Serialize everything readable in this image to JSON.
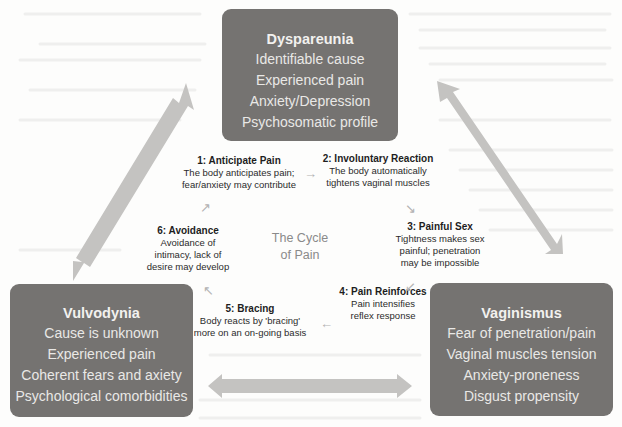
{
  "diagram": {
    "center_label": {
      "line1": "The Cycle",
      "line2": "of Pain"
    },
    "conditions": [
      {
        "id": "dyspareunia",
        "title": "Dyspareunia",
        "items": [
          "Identifiable cause",
          "Experienced pain",
          "Anxiety/Depression",
          "Psychosomatic profile"
        ]
      },
      {
        "id": "vulvodynia",
        "title": "Vulvodynia",
        "items": [
          "Cause is unknown",
          "Experienced pain",
          "Coherent fears and axiety",
          "Psychological comorbidities"
        ]
      },
      {
        "id": "vaginismus",
        "title": "Vaginismus",
        "items": [
          "Fear of penetration/pain",
          "Vaginal muscles tension",
          "Anxiety-proneness",
          "Disgust propensity"
        ]
      }
    ],
    "cycle_steps": [
      {
        "title": "1: Anticipate Pain",
        "lines": [
          "The body anticipates pain;",
          "fear/anxiety may contribute"
        ]
      },
      {
        "title": "2: Involuntary Reaction",
        "lines": [
          "The body automatically",
          "tightens vaginal muscles"
        ]
      },
      {
        "title": "3: Painful Sex",
        "lines": [
          "Tightness makes sex",
          "painful; penetration",
          "may be impossible"
        ]
      },
      {
        "title": "4: Pain Reinforces",
        "lines": [
          "Pain intensifies",
          "reflex response"
        ]
      },
      {
        "title": "5: Bracing",
        "lines": [
          "Body reacts by 'bracing'",
          "more on an on-going basis"
        ]
      },
      {
        "title": "6: Avoidance",
        "lines": [
          "Avoidance of",
          "intimacy, lack of",
          "desire may develop"
        ]
      }
    ],
    "cycle_arrows": {
      "a1_to_2": "→",
      "a2_to_3": "↘",
      "a3_to_4": "↙",
      "a4_to_5": "←",
      "a5_to_6": "↖",
      "a6_to_1": "↗"
    },
    "colors": {
      "box_fill": "#757371",
      "box_text": "#e9e8e6",
      "double_arrow": "#c4c3c1",
      "step_text": "#2b2b2b",
      "center_text": "#8a8a8a",
      "mini_arrow": "#b3b3b3"
    }
  }
}
